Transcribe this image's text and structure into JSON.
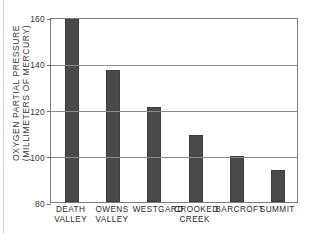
{
  "chart_data": {
    "type": "bar",
    "title": "",
    "xlabel": "",
    "ylabel_lines": [
      "OXYGEN PARTIAL PRESSURE",
      "(MILLIMETERS OF MERCURY)"
    ],
    "ylabel": "OXYGEN PARTIAL PRESSURE (MILLIMETERS OF MERCURY)",
    "categories": [
      "DEATH VALLEY",
      "OWENS VALLEY",
      "WESTGARD",
      "CROOKED CREEK",
      "BARCROFT",
      "SUMMIT"
    ],
    "category_lines": [
      [
        "DEATH",
        "VALLEY"
      ],
      [
        "OWENS",
        "VALLEY"
      ],
      [
        "WESTGARD",
        ""
      ],
      [
        "CROOKED",
        "CREEK"
      ],
      [
        "BARCROFT",
        ""
      ],
      [
        "SUMMIT",
        ""
      ]
    ],
    "values": [
      159,
      137,
      121,
      109,
      100,
      94
    ],
    "ylim": [
      80,
      160
    ],
    "yticks": [
      80,
      100,
      120,
      140,
      160
    ],
    "ytick_labels": [
      "80",
      "100",
      "120",
      "140",
      "160"
    ],
    "grid": true,
    "legend": false,
    "bar_color": "#4a4a4a",
    "axis_color": "#7d7d7d",
    "background": "#ffffff"
  }
}
